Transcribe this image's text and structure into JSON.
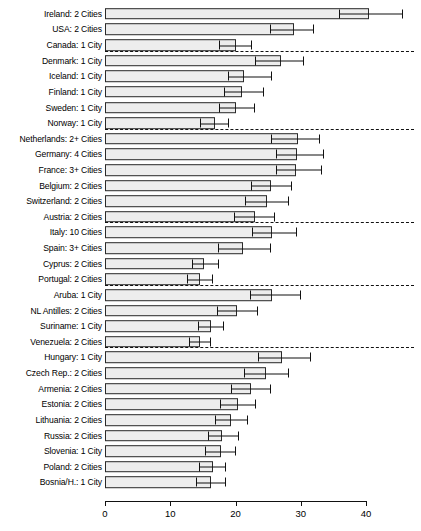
{
  "chart_data": {
    "type": "bar",
    "orientation": "horizontal",
    "title": "",
    "xlabel": "",
    "ylabel": "",
    "xlim": [
      0,
      40
    ],
    "xticks": [
      0,
      10,
      20,
      30,
      40
    ],
    "xticklabels": [
      "0",
      "10",
      "20",
      "30",
      "40"
    ],
    "grid": false,
    "legend": null,
    "error_bars": "horizontal whiskers with caps",
    "categories": [
      "Ireland: 2 Cities",
      "USA: 2 Cities",
      "Canada: 1 City",
      "Denmark: 1 City",
      "Iceland: 1 City",
      "Finland: 1 City",
      "Sweden: 1 City",
      "Norway: 1 City",
      "Netherlands: 2+ Cities",
      "Germany: 4 Cities",
      "France: 3+ Cities",
      "Belgium: 2 Cities",
      "Switzerland: 2 Cities",
      "Austria: 2 Cities",
      "Italy: 10 Cities",
      "Spain: 3+ Cities",
      "Cyprus: 2 Cities",
      "Portugal: 2 Cities",
      "Aruba: 1 City",
      "NL Antilles: 2 Cities",
      "Suriname: 1 City",
      "Venezuela: 2 Cities",
      "Hungary: 1 City",
      "Czech Rep.: 2 Cities",
      "Armenia: 2 Cities",
      "Estonia: 2 Cities",
      "Lithuania: 2 Cities",
      "Russia: 2 Cities",
      "Slovenia: 1 City",
      "Poland: 2 Cities",
      "Bosnia/H.: 1 City"
    ],
    "values": [
      40.4,
      29.0,
      20.0,
      27.0,
      21.3,
      21.0,
      20.0,
      16.8,
      29.6,
      29.5,
      29.3,
      25.5,
      24.9,
      23.0,
      25.6,
      21.2,
      15.2,
      14.5,
      25.6,
      20.2,
      16.2,
      14.5,
      27.2,
      24.6,
      22.3,
      20.4,
      19.3,
      18.0,
      17.8,
      16.5,
      16.3
    ],
    "err_low": [
      35.9,
      25.3,
      17.5,
      23.0,
      18.8,
      18.3,
      17.5,
      14.6,
      25.5,
      26.2,
      26.2,
      22.3,
      21.5,
      19.8,
      22.5,
      17.3,
      13.3,
      12.5,
      22.2,
      17.2,
      14.3,
      12.8,
      23.5,
      21.3,
      19.3,
      17.6,
      16.8,
      15.8,
      15.4,
      14.4,
      14.0
    ],
    "err_high": [
      45.6,
      32.1,
      22.5,
      30.5,
      25.6,
      24.4,
      23.0,
      19.0,
      33.0,
      33.5,
      33.3,
      28.7,
      28.2,
      26.0,
      29.4,
      25.5,
      17.5,
      16.5,
      30.0,
      23.5,
      18.2,
      16.3,
      31.5,
      28.2,
      25.5,
      23.2,
      21.9,
      20.5,
      20.1,
      18.6,
      18.6
    ],
    "group_separators_after": [
      2,
      7,
      13,
      17,
      21
    ],
    "groups": [
      {
        "name": "group-1",
        "rows": [
          "Ireland: 2 Cities",
          "USA: 2 Cities",
          "Canada: 1 City"
        ]
      },
      {
        "name": "group-2",
        "rows": [
          "Denmark: 1 City",
          "Iceland: 1 City",
          "Finland: 1 City",
          "Sweden: 1 City",
          "Norway: 1 City"
        ]
      },
      {
        "name": "group-3",
        "rows": [
          "Netherlands: 2+ Cities",
          "Germany: 4 Cities",
          "France: 3+ Cities",
          "Belgium: 2 Cities",
          "Switzerland: 2 Cities",
          "Austria: 2 Cities"
        ]
      },
      {
        "name": "group-4",
        "rows": [
          "Italy: 10 Cities",
          "Spain: 3+ Cities",
          "Cyprus: 2 Cities",
          "Portugal: 2 Cities"
        ]
      },
      {
        "name": "group-5",
        "rows": [
          "Aruba: 1 City",
          "NL Antilles: 2 Cities",
          "Suriname: 1 City",
          "Venezuela: 2 Cities"
        ]
      },
      {
        "name": "group-6",
        "rows": [
          "Hungary: 1 City",
          "Czech Rep.: 2 Cities",
          "Armenia: 2 Cities",
          "Estonia: 2 Cities",
          "Lithuania: 2 Cities",
          "Russia: 2 Cities",
          "Slovenia: 1 City",
          "Poland: 2 Cities",
          "Bosnia/H.: 1 City"
        ]
      }
    ],
    "colors": {
      "bar_fill": "#ededed",
      "bar_border": "#2a2a2a",
      "whisker": "#111111",
      "separator": "#111111",
      "axis": "#111111",
      "background": "#ffffff"
    }
  }
}
